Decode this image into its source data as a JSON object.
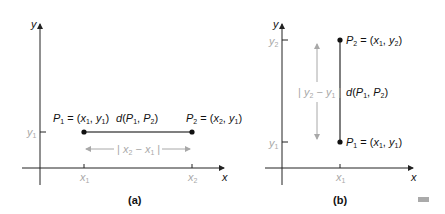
{
  "panel_a": {
    "caption": "(a)",
    "y_axis_label": "y",
    "x_axis_label": "x",
    "y_tick": "y",
    "y_tick_sub": "1",
    "x_ticks": [
      {
        "main": "x",
        "sub": "1"
      },
      {
        "main": "x",
        "sub": "2"
      }
    ],
    "p1_label": {
      "name": "P",
      "sub": "1",
      "eq": " = (",
      "a": "x",
      "asub": "1",
      "b": "y",
      "bsub": "1"
    },
    "p2_label": {
      "name": "P",
      "sub": "2",
      "eq": " = (",
      "a": "x",
      "asub": "2",
      "b": "y",
      "bsub": "1"
    },
    "distance_label": {
      "d": "d(",
      "p1": "P",
      "p1sub": "1",
      "p2": "P",
      "p2sub": "2"
    },
    "difference_label": {
      "a": "x",
      "asub": "2",
      "b": "x",
      "bsub": "1"
    }
  },
  "panel_b": {
    "caption": "(b)",
    "y_axis_label": "y",
    "x_axis_label": "x",
    "y_ticks": [
      {
        "main": "y",
        "sub": "2"
      },
      {
        "main": "y",
        "sub": "1"
      }
    ],
    "x_tick": {
      "main": "x",
      "sub": "1"
    },
    "p2_label": {
      "name": "P",
      "sub": "2",
      "a": "x",
      "asub": "1",
      "b": "y",
      "bsub": "2"
    },
    "p1_label": {
      "name": "P",
      "sub": "1",
      "a": "x",
      "asub": "1",
      "b": "y",
      "bsub": "1"
    },
    "distance_label": {
      "d": "d(",
      "p1": "P",
      "p1sub": "1",
      "p2": "P",
      "p2sub": "2"
    },
    "difference_label": {
      "a": "y",
      "asub": "2",
      "b": "y",
      "bsub": "1"
    }
  },
  "colors": {
    "axis": "#222222",
    "segment": "#555555",
    "guide": "#a8a8a8",
    "point": "#111111"
  }
}
